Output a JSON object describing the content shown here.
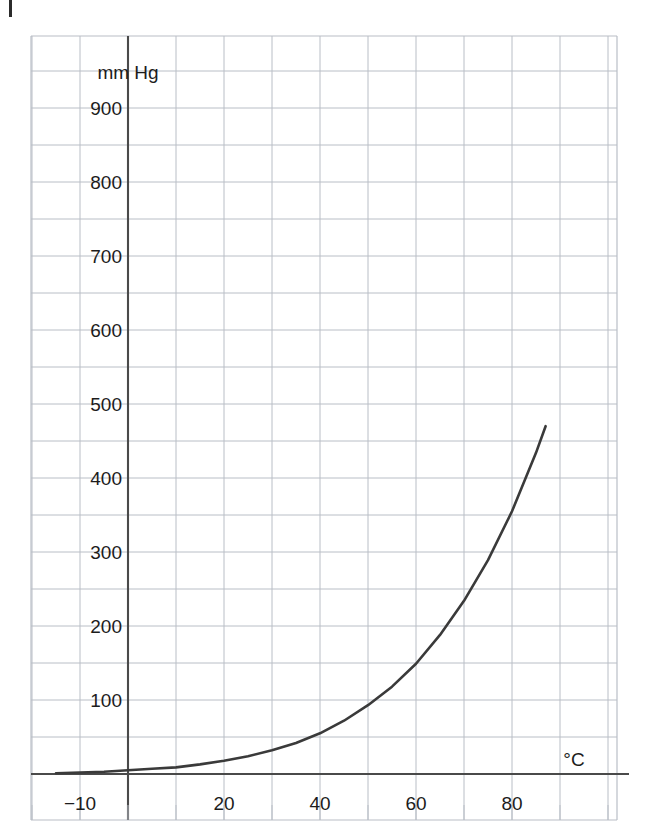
{
  "chart_data": {
    "type": "line",
    "title": "",
    "subtitle": "",
    "xlabel": "°C",
    "ylabel": "mm Hg",
    "xlim": [
      -15,
      95
    ],
    "ylim": [
      -30,
      990
    ],
    "grid": true,
    "grid_x_step": 10,
    "grid_y_step": 50,
    "legend": "none",
    "x_ticks": [
      {
        "value": -10,
        "label": "−10"
      },
      {
        "value": 20,
        "label": "20"
      },
      {
        "value": 40,
        "label": "40"
      },
      {
        "value": 60,
        "label": "60"
      },
      {
        "value": 80,
        "label": "80"
      }
    ],
    "y_ticks": [
      {
        "value": 100,
        "label": "100"
      },
      {
        "value": 200,
        "label": "200"
      },
      {
        "value": 300,
        "label": "300"
      },
      {
        "value": 400,
        "label": "400"
      },
      {
        "value": 500,
        "label": "500"
      },
      {
        "value": 600,
        "label": "600"
      },
      {
        "value": 700,
        "label": "700"
      },
      {
        "value": 800,
        "label": "800"
      },
      {
        "value": 900,
        "label": "900"
      }
    ],
    "series": [
      {
        "name": "vapour pressure",
        "color": "#3a3a3a",
        "x": [
          -15,
          -10,
          -5,
          0,
          5,
          10,
          15,
          20,
          25,
          30,
          35,
          40,
          45,
          50,
          55,
          60,
          65,
          70,
          75,
          80,
          85,
          87
        ],
        "values": [
          1,
          2,
          3,
          5,
          7,
          9,
          13,
          18,
          24,
          32,
          42,
          55,
          72,
          93,
          118,
          149,
          188,
          234,
          289,
          355,
          434,
          470
        ]
      }
    ],
    "curve_pixel_anchors": {
      "note": "plot mapping used for rendering",
      "x0_px": 128,
      "px_per_degree": 4.8,
      "y0_px": 774,
      "px_per_mmHg": 0.74
    }
  },
  "colors": {
    "grid": "#b9bec6",
    "axis": "#4a4a4a",
    "curve": "#3a3a3a",
    "text": "#1c1c1c",
    "background": "#ffffff"
  },
  "axis_labels": {
    "y_unit": "mm Hg",
    "x_unit": "°C"
  }
}
